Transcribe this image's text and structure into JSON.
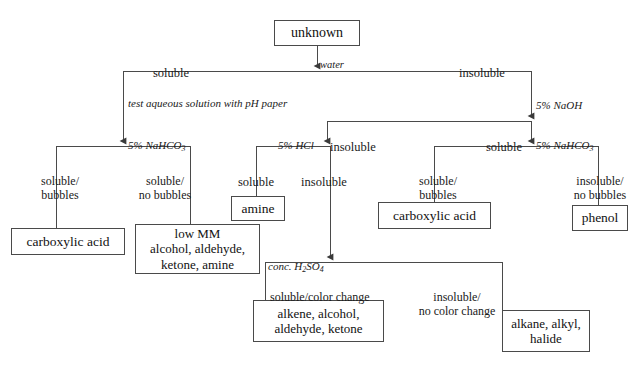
{
  "diagram": {
    "background_color": "#ffffff",
    "line_color": "#4a4a4a",
    "text_color": "#111111"
  },
  "nodes": [
    {
      "id": "unknown",
      "label": "unknown"
    },
    {
      "id": "carboxylic_acid_1",
      "label": "carboxylic acid"
    },
    {
      "id": "low_mm",
      "label": "low MM\nalcohol, aldehyde,\nketone, amine"
    },
    {
      "id": "amine",
      "label": "amine"
    },
    {
      "id": "alkene_group",
      "label": "alkene, alcohol,\naldehyde, ketone"
    },
    {
      "id": "alkane_group",
      "label": "alkane, alkyl,\nhalide"
    },
    {
      "id": "carboxylic_acid_2",
      "label": "carboxylic acid"
    },
    {
      "id": "phenol",
      "label": "phenol"
    }
  ],
  "reagents": [
    {
      "id": "water",
      "label": "water"
    },
    {
      "id": "naoh",
      "label": "5% NaOH"
    },
    {
      "id": "nahco3_left",
      "label_html": "5% NaHCO<sub>3</sub>"
    },
    {
      "id": "hcl",
      "label": "5% HCl"
    },
    {
      "id": "nahco3_right",
      "label_html": "5% NaHCO<sub>3</sub>"
    },
    {
      "id": "h2so4",
      "label_html": "conc. H<sub>2</sub>SO<sub>4</sub>"
    }
  ],
  "notes": [
    {
      "id": "ph_paper",
      "label": "test aqueous solution with pH paper"
    }
  ],
  "branch_labels": [
    {
      "id": "water_soluble",
      "label": "soluble"
    },
    {
      "id": "water_insoluble",
      "label": "insoluble"
    },
    {
      "id": "nahco3_l_bubbles",
      "label": "soluble/\nbubbles"
    },
    {
      "id": "nahco3_l_no_bubbles",
      "label": "soluble/\nno bubbles"
    },
    {
      "id": "hcl_branch",
      "label": "insoluble"
    },
    {
      "id": "hcl_soluble",
      "label": "soluble"
    },
    {
      "id": "hcl_insoluble",
      "label": "insoluble"
    },
    {
      "id": "naoh_soluble",
      "label": "soluble"
    },
    {
      "id": "nahco3_r_bubbles",
      "label": "soluble/\nbubbles"
    },
    {
      "id": "nahco3_r_no_bubbles",
      "label": "insoluble/\nno bubbles"
    },
    {
      "id": "h2so4_color",
      "label": "soluble/color change"
    },
    {
      "id": "h2so4_no_color",
      "label": "insoluble/\nno color change"
    }
  ]
}
